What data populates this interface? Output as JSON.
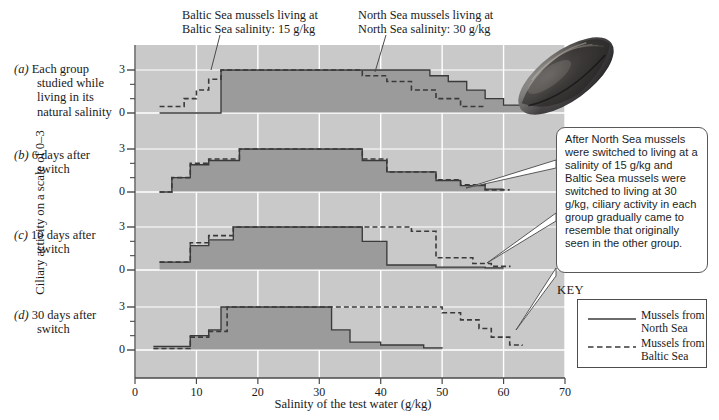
{
  "figure": {
    "background_color": "#ffffff",
    "plot_background": "#c9c9c9",
    "fill_color": "#9b9b9b",
    "grid_color": "#ffffff",
    "line_color": "#3a3a3a"
  },
  "annotations": {
    "baltic_top": "Baltic Sea mussels living at\nBaltic Sea salinity: 15 g/kg",
    "baltic_top_line1": "Baltic Sea mussels living at",
    "baltic_top_line2": "Baltic Sea salinity: 15 g/kg",
    "north_top_line1": "North Sea mussels living at",
    "north_top_line2": "North Sea salinity: 30 g/kg",
    "callout": "After North Sea mussels were switched to living at a salinity of 15 g/kg and Baltic Sea mussels were switched to living at 30 g/kg, ciliary activity in each group gradually came to resemble that originally seen in the other group."
  },
  "key": {
    "title": "KEY",
    "items": [
      {
        "label_line1": "Mussels from",
        "label_line2": "North Sea",
        "style": "solid"
      },
      {
        "label_line1": "Mussels from",
        "label_line2": "Baltic Sea",
        "style": "dashed"
      }
    ]
  },
  "axes": {
    "xlabel": "Salinity of the test water (g/kg)",
    "ylabel": "Ciliary activity on a scale of 0–3",
    "xticks": [
      "0",
      "10",
      "20",
      "30",
      "40",
      "50",
      "60",
      "70"
    ],
    "xtick_values": [
      0,
      10,
      20,
      30,
      40,
      50,
      60,
      70
    ],
    "xlim": [
      0,
      70
    ],
    "yticks": [
      "0",
      "3"
    ],
    "ylim": [
      0,
      3
    ]
  },
  "panels": [
    {
      "id": "a",
      "marker": "(a)",
      "label_line1": "Each group",
      "label_line2": "studied while",
      "label_line3": "living in its",
      "label_line4": "natural salinity"
    },
    {
      "id": "b",
      "marker": "(b)",
      "label_line1": "6 days after",
      "label_line2": "switch"
    },
    {
      "id": "c",
      "marker": "(c)",
      "label_line1": "10 days after",
      "label_line2": "switch"
    },
    {
      "id": "d",
      "marker": "(d)",
      "label_line1": "30 days after",
      "label_line2": "switch"
    }
  ],
  "chart_data": {
    "type": "line",
    "xlabel": "Salinity of the test water (g/kg)",
    "ylabel": "Ciliary activity on a scale of 0–3",
    "xlim": [
      0,
      70
    ],
    "ylim": [
      0,
      3
    ],
    "xticks": [
      0,
      10,
      20,
      30,
      40,
      50,
      60,
      70
    ],
    "yticks": [
      0,
      1,
      2,
      3
    ],
    "grid": true,
    "legend_position": "bottom-right",
    "step_style": "post",
    "series_names": [
      "Mussels from North Sea",
      "Mussels from Baltic Sea"
    ],
    "panels": [
      {
        "id": "a",
        "caption": "Each group studied while living in its natural salinity",
        "series": [
          {
            "name": "Mussels from North Sea",
            "style": "solid",
            "x": [
              4,
              12,
              14,
              45,
              48,
              51,
              54,
              57,
              60,
              63,
              67
            ],
            "y": [
              0,
              0,
              3,
              3,
              2.6,
              2.2,
              1.6,
              1.0,
              0.55,
              0.3,
              0.3
            ]
          },
          {
            "name": "Mussels from Baltic Sea",
            "style": "dashed",
            "x": [
              4,
              6,
              8,
              10,
              12,
              14,
              33,
              37,
              41,
              45,
              49,
              53,
              57
            ],
            "y": [
              0.45,
              0.45,
              1.0,
              1.6,
              2.35,
              3.0,
              3.0,
              2.6,
              2.2,
              1.6,
              1.0,
              0.45,
              0.45
            ]
          }
        ]
      },
      {
        "id": "b",
        "caption": "6 days after switch",
        "series": [
          {
            "name": "Mussels from North Sea",
            "style": "solid",
            "x": [
              4,
              6,
              9,
              12,
              17,
              33,
              37,
              41,
              45,
              49,
              53,
              57,
              60
            ],
            "y": [
              0,
              1.0,
              1.9,
              2.2,
              3.0,
              3.0,
              2.2,
              1.4,
              1.4,
              0.8,
              0.45,
              0.2,
              0.2
            ]
          },
          {
            "name": "Mussels from Baltic Sea",
            "style": "dashed",
            "x": [
              4,
              6,
              9,
              12,
              17,
              33,
              37,
              41,
              45,
              49,
              53,
              57,
              61
            ],
            "y": [
              0,
              1.0,
              2.0,
              2.3,
              3.0,
              3.0,
              2.3,
              1.4,
              1.4,
              0.85,
              0.5,
              0.15,
              0.15
            ]
          }
        ]
      },
      {
        "id": "c",
        "caption": "10 days after switch",
        "series": [
          {
            "name": "Mussels from North Sea",
            "style": "solid",
            "x": [
              4,
              6,
              9,
              12,
              16,
              33,
              37,
              41,
              45,
              49,
              53,
              57,
              60
            ],
            "y": [
              0.55,
              0.55,
              1.7,
              2.1,
              3.0,
              3.0,
              2.0,
              0.35,
              0.35,
              0.2,
              0.2,
              0.15,
              0.15
            ]
          },
          {
            "name": "Mussels from Baltic Sea",
            "style": "dashed",
            "x": [
              4,
              6,
              9,
              12,
              16,
              41,
              45,
              49,
              51,
              55,
              58,
              61
            ],
            "y": [
              0.55,
              0.55,
              1.9,
              2.4,
              3.0,
              3.0,
              2.7,
              0.85,
              0.85,
              0.45,
              0.25,
              0.2
            ]
          }
        ]
      },
      {
        "id": "d",
        "caption": "30 days after switch",
        "series": [
          {
            "name": "Mussels from North Sea",
            "style": "solid",
            "x": [
              3,
              7,
              9,
              12,
              14,
              17,
              32,
              35,
              40,
              47,
              50
            ],
            "y": [
              0.25,
              0.25,
              1.0,
              1.4,
              3.0,
              3.0,
              1.4,
              0.55,
              0.35,
              0.15,
              0.1
            ]
          },
          {
            "name": "Mussels from Baltic Sea",
            "style": "dashed",
            "x": [
              3,
              7,
              9,
              12,
              15,
              46,
              50,
              53,
              56,
              58,
              61,
              63
            ],
            "y": [
              0.1,
              0.1,
              0.9,
              1.3,
              3.0,
              3.0,
              2.6,
              2.1,
              1.5,
              0.9,
              0.35,
              0.3
            ]
          }
        ]
      }
    ]
  }
}
